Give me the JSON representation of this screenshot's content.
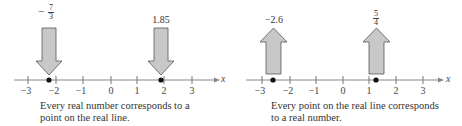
{
  "panels": [
    {
      "id": "left",
      "caption_line1": "Every real number corresponds to a",
      "caption_line2": "point on the real line.",
      "axis_label": "x",
      "ticks": [
        "−3",
        "−2",
        "−1",
        "0",
        "1",
        "2",
        "3"
      ],
      "arrow_direction": "down",
      "points": [
        {
          "label_type": "fraction",
          "sign": "−",
          "numerator": "7",
          "denominator": "3",
          "value": -2.333
        },
        {
          "label_type": "text",
          "label": "1.85",
          "value": 1.85
        }
      ]
    },
    {
      "id": "right",
      "caption_line1": "Every point on the real line corresponds",
      "caption_line2": "to a real number.",
      "axis_label": "x",
      "ticks": [
        "−3",
        "−2",
        "−1",
        "0",
        "1",
        "2",
        "3"
      ],
      "arrow_direction": "up",
      "points": [
        {
          "label_type": "text",
          "label": "−2.6",
          "value": -2.6
        },
        {
          "label_type": "fraction",
          "sign": "",
          "numerator": "5",
          "denominator": "4",
          "value": 1.25
        }
      ]
    }
  ],
  "colors": {
    "arrow_fill": "#c8c8c8",
    "arrow_stroke": "#555555",
    "axis": "#777777",
    "dot": "#111111"
  }
}
